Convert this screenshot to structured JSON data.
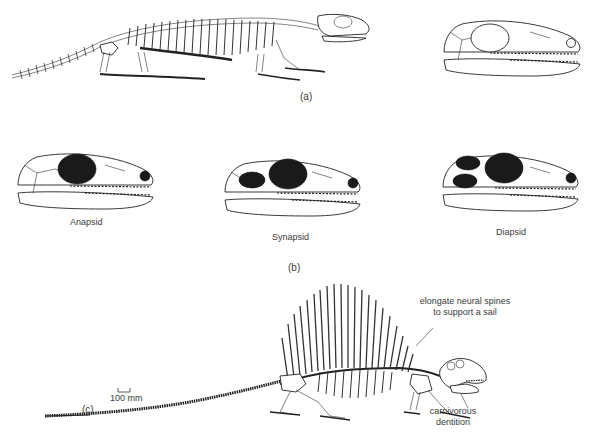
{
  "figure": {
    "panels": [
      {
        "id": "a",
        "label": "(a)",
        "content": "Full skeleton of an early reptile in side view, with enlarged skull drawing showing no temporal openings"
      },
      {
        "id": "b",
        "label": "(b)",
        "skulls": [
          {
            "name": "Anapsid",
            "temporal_openings": 0
          },
          {
            "name": "Synapsid",
            "temporal_openings": 1
          },
          {
            "name": "Diapsid",
            "temporal_openings": 2
          }
        ]
      },
      {
        "id": "c",
        "label": "(c)",
        "content": "Sail-backed synapsid (Dimetrodon) skeleton",
        "scale_bar": "100 mm",
        "annotations": [
          {
            "text_line1": "elongate neural spines",
            "text_line2": "to support a sail"
          },
          {
            "text_line1": "carnivorous",
            "text_line2": "dentition"
          }
        ]
      }
    ]
  }
}
